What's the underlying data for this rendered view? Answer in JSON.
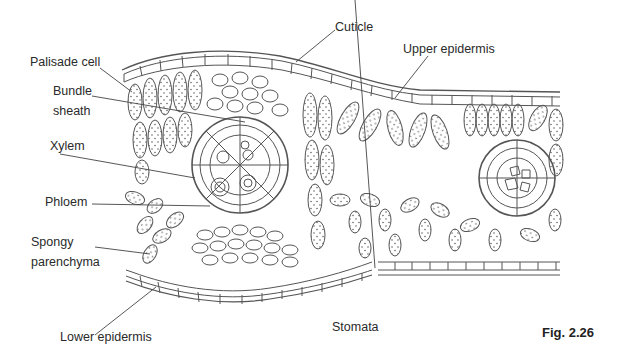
{
  "figure": {
    "caption": "Fig. 2.26"
  },
  "labels": {
    "cuticle": "Cuticle",
    "upper_epidermis": "Upper epidermis",
    "palisade_cell": "Palisade cell",
    "bundle_sheath_1": "Bundle",
    "bundle_sheath_2": "sheath",
    "xylem": "Xylem",
    "phloem": "Phloem",
    "spongy_1": "Spongy",
    "spongy_2": "parenchyma",
    "lower_epidermis": "Lower epidermis",
    "stomata": "Stomata"
  },
  "colors": {
    "line": "#555555",
    "text": "#2a2a2a",
    "background": "#ffffff"
  }
}
